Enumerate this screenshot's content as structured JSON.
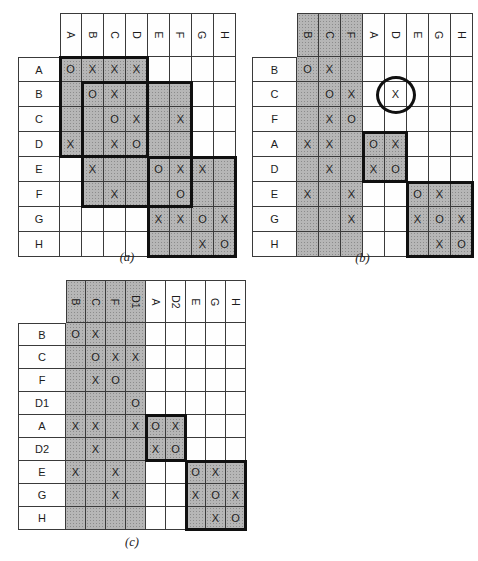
{
  "colors": {
    "background": "#ffffff",
    "cell_white": "#fefefe",
    "shade_base": "#b6b6b6",
    "shade_dot": "#8c8c8c",
    "grid_line": "#3a3a3a",
    "thick_border": "#101010",
    "mark_text": "#222222",
    "label_text": "#1c1c1c"
  },
  "matrices": [
    {
      "id": "a",
      "caption": "(a)",
      "columns": [
        "A",
        "B",
        "C",
        "D",
        "E",
        "F",
        "G",
        "H"
      ],
      "rows": [
        {
          "label": "A",
          "cells": {
            "A": "O",
            "B": "X",
            "C": "X",
            "D": "X"
          }
        },
        {
          "label": "B",
          "cells": {
            "B": "O",
            "C": "X"
          }
        },
        {
          "label": "C",
          "cells": {
            "C": "O",
            "D": "X",
            "F": "X"
          }
        },
        {
          "label": "D",
          "cells": {
            "A": "X",
            "C": "X",
            "D": "O"
          }
        },
        {
          "label": "E",
          "cells": {
            "B": "X",
            "E": "O",
            "F": "X",
            "G": "X"
          }
        },
        {
          "label": "F",
          "cells": {
            "C": "X",
            "F": "O"
          }
        },
        {
          "label": "G",
          "cells": {
            "E": "X",
            "F": "X",
            "G": "O",
            "H": "X"
          }
        },
        {
          "label": "H",
          "cells": {
            "G": "X",
            "H": "O"
          }
        }
      ],
      "shaded_columns": [],
      "blocks": [
        {
          "rows": [
            0,
            3
          ],
          "cols": [
            0,
            3
          ]
        },
        {
          "rows": [
            1,
            5
          ],
          "cols": [
            1,
            5
          ]
        },
        {
          "rows": [
            4,
            7
          ],
          "cols": [
            4,
            7
          ]
        }
      ],
      "annotations": []
    },
    {
      "id": "b",
      "caption": "(b)",
      "columns": [
        "B",
        "C",
        "F",
        "A",
        "D",
        "E",
        "G",
        "H"
      ],
      "rows": [
        {
          "label": "B",
          "cells": {
            "B": "O",
            "C": "X"
          }
        },
        {
          "label": "C",
          "cells": {
            "C": "O",
            "F": "X",
            "D": "X"
          }
        },
        {
          "label": "F",
          "cells": {
            "C": "X",
            "F": "O"
          }
        },
        {
          "label": "A",
          "cells": {
            "B": "X",
            "C": "X",
            "A": "O",
            "D": "X"
          }
        },
        {
          "label": "D",
          "cells": {
            "C": "X",
            "A": "X",
            "D": "O"
          }
        },
        {
          "label": "E",
          "cells": {
            "B": "X",
            "F": "X",
            "E": "O",
            "G": "X"
          }
        },
        {
          "label": "G",
          "cells": {
            "F": "X",
            "E": "X",
            "G": "O",
            "H": "X"
          }
        },
        {
          "label": "H",
          "cells": {
            "G": "X",
            "H": "O"
          }
        }
      ],
      "shaded_columns": [
        "B",
        "C",
        "F"
      ],
      "blocks": [
        {
          "rows": [
            3,
            4
          ],
          "cols": [
            3,
            4
          ]
        },
        {
          "rows": [
            5,
            7
          ],
          "cols": [
            5,
            7
          ]
        }
      ],
      "annotations": [
        {
          "type": "circle",
          "row": "C",
          "col": "D"
        }
      ]
    },
    {
      "id": "c",
      "caption": "(c)",
      "columns": [
        "B",
        "C",
        "F",
        "D1",
        "A",
        "D2",
        "E",
        "G",
        "H"
      ],
      "rows": [
        {
          "label": "B",
          "cells": {
            "B": "O",
            "C": "X"
          }
        },
        {
          "label": "C",
          "cells": {
            "C": "O",
            "F": "X",
            "D1": "X"
          }
        },
        {
          "label": "F",
          "cells": {
            "C": "X",
            "F": "O"
          }
        },
        {
          "label": "D1",
          "cells": {
            "D1": "O"
          }
        },
        {
          "label": "A",
          "cells": {
            "B": "X",
            "C": "X",
            "D1": "X",
            "A": "O",
            "D2": "X"
          }
        },
        {
          "label": "D2",
          "cells": {
            "C": "X",
            "A": "X",
            "D2": "O"
          }
        },
        {
          "label": "E",
          "cells": {
            "B": "X",
            "F": "X",
            "E": "O",
            "G": "X"
          }
        },
        {
          "label": "G",
          "cells": {
            "F": "X",
            "E": "X",
            "G": "O",
            "H": "X"
          }
        },
        {
          "label": "H",
          "cells": {
            "G": "X",
            "H": "O"
          }
        }
      ],
      "shaded_columns": [
        "B",
        "C",
        "F",
        "D1"
      ],
      "blocks": [
        {
          "rows": [
            4,
            5
          ],
          "cols": [
            4,
            5
          ]
        },
        {
          "rows": [
            6,
            8
          ],
          "cols": [
            6,
            8
          ]
        }
      ],
      "annotations": []
    }
  ]
}
